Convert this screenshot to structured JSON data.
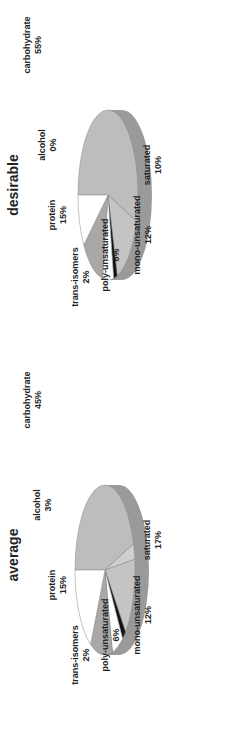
{
  "chart_data": [
    {
      "type": "pie",
      "title": "average",
      "labels": [
        "carbohydrate",
        "alcohol",
        "protein",
        "trans-isomers",
        "poly-unsaturated",
        "mono-unsaturated",
        "saturated"
      ],
      "values": [
        45,
        3,
        15,
        2,
        6,
        12,
        17
      ],
      "display": [
        "carbohydrate 45%",
        "alcohol 3%",
        "protein 15%",
        "trans-isomers 2%",
        "poly-unsaturated 6%",
        "mono-unsaturated 12%",
        "saturated 17%"
      ]
    },
    {
      "type": "pie",
      "title": "desirable",
      "labels": [
        "carbohydrate",
        "alcohol",
        "protein",
        "trans-isomers",
        "poly-unsaturated",
        "mono-unsaturated",
        "saturated"
      ],
      "values": [
        55,
        0,
        15,
        2,
        6,
        12,
        10
      ],
      "display": [
        "carbohydrate 55%",
        "alcohol 0%",
        "protein 15%",
        "trans-isomers 2%",
        "poly-unsaturated 6%",
        "mono-unsaturated 12%",
        "saturated 10%"
      ]
    }
  ],
  "colors": {
    "carbohydrate": "#bdbdbd",
    "alcohol": "#cfcfcf",
    "protein": "#c4c4c4",
    "trans-isomers": "#111111",
    "poly-unsaturated": "#ffffff",
    "mono-unsaturated": "#a8a8a8",
    "saturated": "#ffffff",
    "side_dark": "#6e6e6e",
    "side_mid": "#9a9a9a"
  }
}
